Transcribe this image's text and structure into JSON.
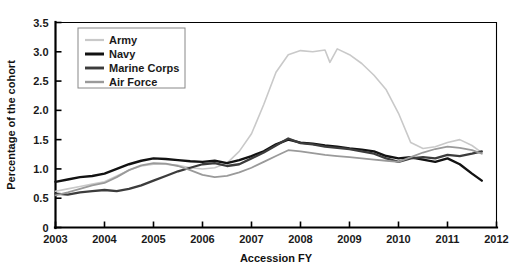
{
  "chart_data": {
    "type": "line",
    "title": "",
    "xlabel": "Accession FY",
    "ylabel": "Percentage of the cohort",
    "xlim": [
      2003,
      2012
    ],
    "ylim": [
      0,
      3.5
    ],
    "xticks": [
      "2003",
      "2004",
      "2005",
      "2006",
      "2007",
      "2008",
      "2009",
      "2010",
      "2011",
      "2012"
    ],
    "yticks": [
      "0",
      "0.5",
      "1.0",
      "1.5",
      "2.0",
      "2.5",
      "3.0",
      "3.5"
    ],
    "grid": false,
    "legend_position": "top-left",
    "series": [
      {
        "name": "Army",
        "color": "#c9c9c9",
        "width": 1.6,
        "x": [
          2003.0,
          2003.25,
          2003.5,
          2003.75,
          2004.0,
          2004.25,
          2004.5,
          2004.75,
          2005.0,
          2005.25,
          2005.5,
          2005.75,
          2006.0,
          2006.25,
          2006.5,
          2006.75,
          2007.0,
          2007.25,
          2007.5,
          2007.75,
          2008.0,
          2008.25,
          2008.5,
          2008.6,
          2008.75,
          2009.0,
          2009.25,
          2009.5,
          2009.75,
          2010.0,
          2010.25,
          2010.5,
          2010.75,
          2011.0,
          2011.25,
          2011.5,
          2011.7
        ],
        "values": [
          0.62,
          0.66,
          0.7,
          0.74,
          0.78,
          0.88,
          0.98,
          1.05,
          1.08,
          1.08,
          1.06,
          1.02,
          1.0,
          1.02,
          1.1,
          1.3,
          1.6,
          2.1,
          2.65,
          2.95,
          3.02,
          3.0,
          3.03,
          2.82,
          3.05,
          2.95,
          2.8,
          2.6,
          2.35,
          1.95,
          1.45,
          1.35,
          1.38,
          1.45,
          1.5,
          1.4,
          1.28
        ]
      },
      {
        "name": "Navy",
        "color": "#121212",
        "width": 2.4,
        "x": [
          2003.0,
          2003.25,
          2003.5,
          2003.75,
          2004.0,
          2004.25,
          2004.5,
          2004.75,
          2005.0,
          2005.25,
          2005.5,
          2005.75,
          2006.0,
          2006.25,
          2006.5,
          2006.75,
          2007.0,
          2007.25,
          2007.5,
          2007.75,
          2008.0,
          2008.25,
          2008.5,
          2008.75,
          2009.0,
          2009.25,
          2009.5,
          2009.75,
          2010.0,
          2010.25,
          2010.5,
          2010.75,
          2011.0,
          2011.25,
          2011.5,
          2011.7
        ],
        "values": [
          0.78,
          0.82,
          0.86,
          0.88,
          0.92,
          1.0,
          1.08,
          1.14,
          1.18,
          1.17,
          1.15,
          1.13,
          1.12,
          1.14,
          1.1,
          1.15,
          1.22,
          1.3,
          1.42,
          1.5,
          1.45,
          1.43,
          1.4,
          1.38,
          1.35,
          1.33,
          1.3,
          1.22,
          1.18,
          1.2,
          1.16,
          1.12,
          1.18,
          1.08,
          0.92,
          0.8
        ]
      },
      {
        "name": "Marine Corps",
        "color": "#3c3c3c",
        "width": 2.3,
        "x": [
          2003.0,
          2003.25,
          2003.5,
          2003.75,
          2004.0,
          2004.25,
          2004.5,
          2004.75,
          2005.0,
          2005.25,
          2005.5,
          2005.75,
          2006.0,
          2006.25,
          2006.5,
          2006.75,
          2007.0,
          2007.25,
          2007.5,
          2007.75,
          2008.0,
          2008.25,
          2008.5,
          2008.75,
          2009.0,
          2009.25,
          2009.5,
          2009.75,
          2010.0,
          2010.25,
          2010.5,
          2010.75,
          2011.0,
          2011.25,
          2011.5,
          2011.7
        ],
        "values": [
          0.58,
          0.56,
          0.6,
          0.62,
          0.64,
          0.62,
          0.66,
          0.72,
          0.8,
          0.88,
          0.96,
          1.02,
          1.08,
          1.1,
          1.05,
          1.08,
          1.18,
          1.28,
          1.4,
          1.52,
          1.44,
          1.42,
          1.38,
          1.36,
          1.34,
          1.3,
          1.26,
          1.18,
          1.12,
          1.18,
          1.2,
          1.18,
          1.24,
          1.22,
          1.26,
          1.3
        ]
      },
      {
        "name": "Air Force",
        "color": "#9a9a9a",
        "width": 1.8,
        "x": [
          2003.0,
          2003.25,
          2003.5,
          2003.75,
          2004.0,
          2004.25,
          2004.5,
          2004.75,
          2005.0,
          2005.25,
          2005.5,
          2005.75,
          2006.0,
          2006.25,
          2006.5,
          2006.75,
          2007.0,
          2007.25,
          2007.5,
          2007.75,
          2008.0,
          2008.25,
          2008.5,
          2008.75,
          2009.0,
          2009.25,
          2009.5,
          2009.75,
          2010.0,
          2010.25,
          2010.5,
          2010.75,
          2011.0,
          2011.25,
          2011.5,
          2011.7
        ],
        "values": [
          0.55,
          0.6,
          0.66,
          0.72,
          0.76,
          0.86,
          0.98,
          1.06,
          1.1,
          1.09,
          1.05,
          0.98,
          0.9,
          0.86,
          0.88,
          0.94,
          1.02,
          1.12,
          1.22,
          1.32,
          1.3,
          1.27,
          1.24,
          1.22,
          1.2,
          1.18,
          1.16,
          1.14,
          1.12,
          1.2,
          1.28,
          1.34,
          1.38,
          1.36,
          1.32,
          1.26
        ]
      }
    ]
  },
  "legend": {
    "items": [
      {
        "label": "Army"
      },
      {
        "label": "Navy"
      },
      {
        "label": "Marine Corps"
      },
      {
        "label": "Air Force"
      }
    ]
  },
  "axes": {
    "x_title": "Accession FY",
    "y_title": "Percentage of the cohort"
  }
}
